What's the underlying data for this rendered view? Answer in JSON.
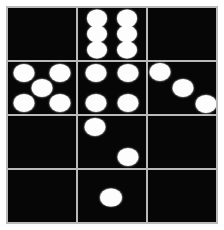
{
  "figure": {
    "background_color": "#ffffff",
    "grid_line_color": "#b9b9b9",
    "cell_color": "#060606",
    "pip_color": "#fdfdfd",
    "rows": 4,
    "columns": 3
  },
  "chart_data": {
    "type": "table",
    "xlabel": "",
    "ylabel": "",
    "categories": [
      "column-1",
      "column-2",
      "column-3"
    ],
    "row_labels": [
      "row-1",
      "row-2",
      "row-3",
      "row-4"
    ],
    "series": [
      {
        "name": "row-1",
        "values": [
          0,
          6,
          0
        ]
      },
      {
        "name": "row-2",
        "values": [
          5,
          4,
          3
        ]
      },
      {
        "name": "row-3",
        "values": [
          0,
          2,
          0
        ]
      },
      {
        "name": "row-4",
        "values": [
          0,
          1,
          0
        ]
      }
    ]
  },
  "cells": [
    {
      "id": "cell-r1c1",
      "row": 1,
      "column": 1,
      "pip_count": 0,
      "pattern": "blank",
      "pips": []
    },
    {
      "id": "cell-r1c2",
      "row": 1,
      "column": 2,
      "pip_count": 6,
      "pattern": "six-two-by-three",
      "pips": [
        {
          "x": 28,
          "y": 20,
          "d": 20
        },
        {
          "x": 72,
          "y": 20,
          "d": 20
        },
        {
          "x": 28,
          "y": 50,
          "d": 20
        },
        {
          "x": 72,
          "y": 50,
          "d": 20
        },
        {
          "x": 28,
          "y": 80,
          "d": 20
        },
        {
          "x": 72,
          "y": 80,
          "d": 20
        }
      ]
    },
    {
      "id": "cell-r1c3",
      "row": 1,
      "column": 3,
      "pip_count": 0,
      "pattern": "blank",
      "pips": []
    },
    {
      "id": "cell-r2c1",
      "row": 2,
      "column": 1,
      "pip_count": 5,
      "pattern": "five-quincunx",
      "pips": [
        {
          "x": 24,
          "y": 22,
          "d": 21
        },
        {
          "x": 76,
          "y": 22,
          "d": 21
        },
        {
          "x": 50,
          "y": 50,
          "d": 21
        },
        {
          "x": 24,
          "y": 79,
          "d": 21
        },
        {
          "x": 76,
          "y": 79,
          "d": 21
        }
      ]
    },
    {
      "id": "cell-r2c2",
      "row": 2,
      "column": 2,
      "pip_count": 4,
      "pattern": "four-corners",
      "pips": [
        {
          "x": 26,
          "y": 22,
          "d": 21
        },
        {
          "x": 74,
          "y": 22,
          "d": 21
        },
        {
          "x": 26,
          "y": 79,
          "d": 21
        },
        {
          "x": 74,
          "y": 79,
          "d": 21
        }
      ]
    },
    {
      "id": "cell-r2c3",
      "row": 2,
      "column": 3,
      "pip_count": 3,
      "pattern": "three-diagonal",
      "pips": [
        {
          "x": 18,
          "y": 20,
          "d": 21
        },
        {
          "x": 51,
          "y": 50,
          "d": 21
        },
        {
          "x": 85,
          "y": 80,
          "d": 21
        }
      ]
    },
    {
      "id": "cell-r3c1",
      "row": 3,
      "column": 1,
      "pip_count": 0,
      "pattern": "blank",
      "pips": []
    },
    {
      "id": "cell-r3c2",
      "row": 3,
      "column": 2,
      "pip_count": 2,
      "pattern": "two-diagonal",
      "pips": [
        {
          "x": 25,
          "y": 21,
          "d": 21
        },
        {
          "x": 73,
          "y": 79,
          "d": 21
        }
      ]
    },
    {
      "id": "cell-r3c3",
      "row": 3,
      "column": 3,
      "pip_count": 0,
      "pattern": "blank",
      "pips": []
    },
    {
      "id": "cell-r4c1",
      "row": 4,
      "column": 1,
      "pip_count": 0,
      "pattern": "blank",
      "pips": []
    },
    {
      "id": "cell-r4c2",
      "row": 4,
      "column": 2,
      "pip_count": 1,
      "pattern": "one-center",
      "pips": [
        {
          "x": 48,
          "y": 53,
          "d": 22
        }
      ]
    },
    {
      "id": "cell-r4c3",
      "row": 4,
      "column": 3,
      "pip_count": 0,
      "pattern": "blank",
      "pips": []
    }
  ]
}
